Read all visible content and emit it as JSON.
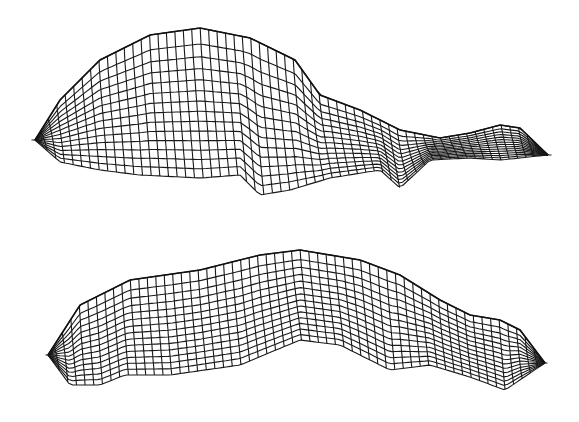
{
  "figure": {
    "views": [
      {
        "id": "top",
        "label": "",
        "stroke": "#1a1a1a",
        "background": "#ffffff"
      },
      {
        "id": "bottom",
        "label": "",
        "stroke": "#1a1a1a",
        "background": "#ffffff"
      }
    ]
  }
}
